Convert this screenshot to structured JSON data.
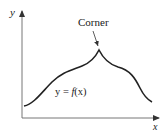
{
  "diagram": {
    "type": "function-graph",
    "axes": {
      "x_label": "x",
      "y_label": "y"
    },
    "annotation": {
      "label": "Corner",
      "points_to": "cusp-peak"
    },
    "curve": {
      "label_prefix": "y = ",
      "label_func": "f",
      "label_arg": "(x)",
      "description": "smooth curve rising to a sharp corner (cusp) then falling"
    },
    "colors": {
      "curve": "#222222",
      "axes": "#555555",
      "text": "#1a1a1a"
    }
  }
}
